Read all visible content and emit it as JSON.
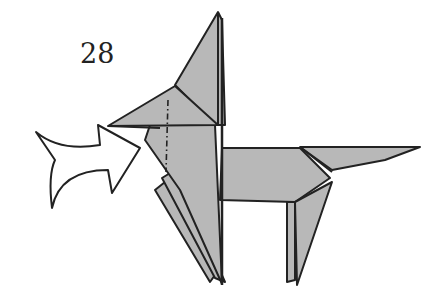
{
  "diagram": {
    "step_number": "28",
    "colors": {
      "paper_fill": "#b8b8b8",
      "outline": "#222222",
      "arrow_fill": "#ffffff",
      "background": "#ffffff"
    },
    "arrow": {
      "type": "push-arrow",
      "direction": "right"
    },
    "fold_line": {
      "type": "mountain-fold",
      "style": "dash-dot"
    }
  }
}
